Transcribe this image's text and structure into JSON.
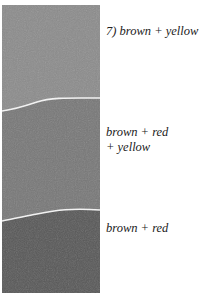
{
  "samples": [
    {
      "label": "7) brown + yellow",
      "color": "#8a8a8a"
    },
    {
      "label_line1": "brown + red",
      "label_line2": "+ yellow",
      "color": "#7a7a7a"
    },
    {
      "label": "brown + red",
      "color": "#5a5a5a"
    }
  ],
  "divider_color": "#f2f2f2"
}
